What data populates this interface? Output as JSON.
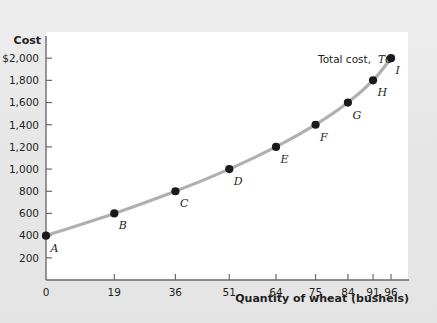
{
  "chart_data": {
    "type": "line",
    "title": "",
    "xlabel": "Quantity of wheat (bushels)",
    "ylabel": "Cost",
    "series_label_plain": "Total cost,",
    "series_label_em": "TC",
    "xlim": [
      0,
      101
    ],
    "ylim": [
      0,
      2200
    ],
    "grid": false,
    "legend_position": "inline-right",
    "xticks": [
      "0",
      "19",
      "36",
      "51",
      "64",
      "75",
      "84",
      "91",
      "96"
    ],
    "xtick_values": [
      0,
      19,
      36,
      51,
      64,
      75,
      84,
      91,
      96
    ],
    "yticks": [
      "200",
      "400",
      "600",
      "800",
      "1,000",
      "1,200",
      "1,400",
      "1,600",
      "1,800",
      "$2,000"
    ],
    "ytick_values": [
      200,
      400,
      600,
      800,
      1000,
      1200,
      1400,
      1600,
      1800,
      2000
    ],
    "x": [
      0,
      19,
      36,
      51,
      64,
      75,
      84,
      91,
      96
    ],
    "values": [
      400,
      600,
      800,
      1000,
      1200,
      1400,
      1600,
      1800,
      2000
    ],
    "point_labels": [
      "A",
      "B",
      "C",
      "D",
      "E",
      "F",
      "G",
      "H",
      "I"
    ],
    "series": [
      {
        "name": "Total cost, TC",
        "points": [
          {
            "label": "A",
            "x": 0,
            "y": 400
          },
          {
            "label": "B",
            "x": 19,
            "y": 600
          },
          {
            "label": "C",
            "x": 36,
            "y": 800
          },
          {
            "label": "D",
            "x": 51,
            "y": 1000
          },
          {
            "label": "E",
            "x": 64,
            "y": 1200
          },
          {
            "label": "F",
            "x": 75,
            "y": 1400
          },
          {
            "label": "G",
            "x": 84,
            "y": 1600
          },
          {
            "label": "H",
            "x": 91,
            "y": 1800
          },
          {
            "label": "I",
            "x": 96,
            "y": 2000
          }
        ]
      }
    ],
    "colors": {
      "curve": "#b0b0b0",
      "point": "#1a1a1a",
      "axis": "#6b6b6b",
      "plot_background": "#ffffff",
      "figure_background": "#e7e7e7",
      "text": "#231f20"
    }
  }
}
